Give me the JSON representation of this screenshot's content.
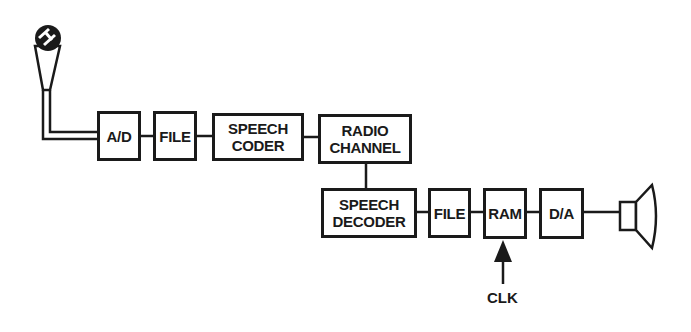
{
  "diagram": {
    "type": "block-diagram",
    "blocks": [
      {
        "id": "ad",
        "lines": [
          "A/D"
        ]
      },
      {
        "id": "file1",
        "lines": [
          "FILE"
        ]
      },
      {
        "id": "speech_coder",
        "lines": [
          "SPEECH",
          "CODER"
        ]
      },
      {
        "id": "radio_channel",
        "lines": [
          "RADIO",
          "CHANNEL"
        ]
      },
      {
        "id": "speech_decoder",
        "lines": [
          "SPEECH",
          "DECODER"
        ]
      },
      {
        "id": "file2",
        "lines": [
          "FILE"
        ]
      },
      {
        "id": "ram",
        "lines": [
          "RAM"
        ]
      },
      {
        "id": "da",
        "lines": [
          "D/A"
        ]
      }
    ],
    "clock_label": "CLK",
    "input_device": "microphone",
    "output_device": "speaker",
    "flow": [
      "microphone",
      "A/D",
      "FILE",
      "SPEECH CODER",
      "RADIO CHANNEL",
      "SPEECH DECODER",
      "FILE",
      "RAM",
      "D/A",
      "speaker"
    ],
    "colors": {
      "stroke": "#1a1a1a",
      "background": "#ffffff"
    }
  }
}
